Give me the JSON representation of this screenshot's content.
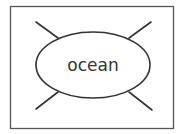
{
  "diagram": {
    "type": "spider-map",
    "center_label": "ocean",
    "branches": [
      {
        "position": "top-left",
        "label": ""
      },
      {
        "position": "top-right",
        "label": ""
      },
      {
        "position": "bottom-left",
        "label": ""
      },
      {
        "position": "bottom-right",
        "label": ""
      }
    ],
    "colors": {
      "stroke": "#333333",
      "background": "#ffffff",
      "frame": "#555555"
    }
  }
}
